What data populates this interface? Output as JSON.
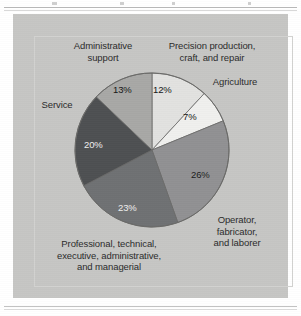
{
  "chart_data": {
    "type": "pie",
    "title": "",
    "subtitle": "",
    "xlabel": "",
    "ylabel": "",
    "legend_position": "callout-labels-around-pie",
    "grid": false,
    "start_angle_deg": 0,
    "direction": "clockwise",
    "categories": [
      "Precision production, craft, and repair",
      "Agriculture",
      "Operator, fabricator, and laborer",
      "Professional, technical, executive, administrative, and managerial",
      "Service",
      "Administrative support"
    ],
    "values": [
      12,
      7,
      26,
      23,
      20,
      13
    ],
    "value_labels": [
      "12%",
      "7%",
      "26%",
      "23%",
      "20%",
      "13%"
    ],
    "colors": [
      "#e2e2e0",
      "#f0f0ee",
      "#919193",
      "#6f7173",
      "#4e5052",
      "#a8a8a6"
    ],
    "slices": [
      {
        "label": "Precision production, craft, and repair",
        "label_lines": [
          "Precision production,",
          "craft, and repair"
        ],
        "value": 12,
        "value_label": "12%",
        "color": "#e2e2e0"
      },
      {
        "label": "Agriculture",
        "label_lines": [
          "Agriculture"
        ],
        "value": 7,
        "value_label": "7%",
        "color": "#f0f0ee"
      },
      {
        "label": "Operator, fabricator, and laborer",
        "label_lines": [
          "Operator,",
          "fabricator,",
          "and laborer"
        ],
        "value": 26,
        "value_label": "26%",
        "color": "#919193"
      },
      {
        "label": "Professional, technical, executive, administrative, and managerial",
        "label_lines": [
          "Professional, technical,",
          "executive, administrative,",
          "and managerial"
        ],
        "value": 23,
        "value_label": "23%",
        "color": "#6f7173"
      },
      {
        "label": "Service",
        "label_lines": [
          "Service"
        ],
        "value": 20,
        "value_label": "20%",
        "color": "#4e5052"
      },
      {
        "label": "Administrative support",
        "label_lines": [
          "Administrative",
          "support"
        ],
        "value": 13,
        "value_label": "13%",
        "color": "#a8a8a6"
      }
    ]
  },
  "labels": {
    "administrative_support": "Administrative\nsupport",
    "precision_production": "Precision production,\ncraft, and repair",
    "agriculture": "Agriculture",
    "service": "Service",
    "operator": "Operator,\nfabricator,\nand laborer",
    "professional": "Professional, technical,\nexecutive, administrative,\nand managerial"
  },
  "percents": {
    "administrative_support": "13%",
    "precision_production": "12%",
    "agriculture": "7%",
    "operator": "26%",
    "professional": "23%",
    "service": "20%"
  },
  "theme": {
    "panel_background": "#c6c6c4",
    "page_background": "#ffffff",
    "text_color": "#2b2b2b",
    "rule_color": "#b9b9b9",
    "slice_outline": "#6a6a68"
  }
}
